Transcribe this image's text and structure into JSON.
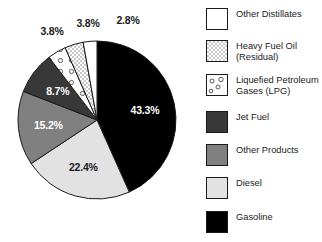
{
  "chart_data": {
    "type": "pie",
    "title": "",
    "subtitle": "",
    "xlabel": "",
    "ylabel": "",
    "start_angle_deg": 0,
    "direction": "clockwise",
    "grid": false,
    "legend_position": "right",
    "categories": [
      "Gasoline",
      "Diesel",
      "Other Products",
      "Jet Fuel",
      "Liquefied Petroleum Gases (LPG)",
      "Heavy Fuel Oil (Residual)",
      "Other Distillates"
    ],
    "values": [
      43.3,
      22.4,
      15.2,
      8.7,
      3.8,
      3.8,
      2.8
    ],
    "data_labels": [
      "43.3%",
      "22.4%",
      "15.2%",
      "8.7%",
      "3.8%",
      "3.8%",
      "2.8%"
    ],
    "units": "percent",
    "slices": [
      {
        "name": "Gasoline",
        "value": 43.3,
        "label": "43.3%",
        "fill": "#000000",
        "pattern": "solid",
        "label_color": "#ffffff"
      },
      {
        "name": "Diesel",
        "value": 22.4,
        "label": "22.4%",
        "fill": "#e2e2e2",
        "pattern": "solid",
        "label_color": "#1a1a1a"
      },
      {
        "name": "Other Products",
        "value": 15.2,
        "label": "15.2%",
        "fill": "#808080",
        "pattern": "solid",
        "label_color": "#ffffff"
      },
      {
        "name": "Jet Fuel",
        "value": 8.7,
        "label": "8.7%",
        "fill": "#383838",
        "pattern": "solid",
        "label_color": "#ffffff"
      },
      {
        "name": "Liquefied Petroleum Gases (LPG)",
        "value": 3.8,
        "label": "3.8%",
        "fill": "#ffffff",
        "pattern": "circles",
        "label_color": "#1a1a1a"
      },
      {
        "name": "Heavy Fuel Oil (Residual)",
        "value": 3.8,
        "label": "3.8%",
        "fill": "#f0f0f0",
        "pattern": "checker",
        "label_color": "#1a1a1a"
      },
      {
        "name": "Other Distillates",
        "value": 2.8,
        "label": "2.8%",
        "fill": "#ffffff",
        "pattern": "solid",
        "label_color": "#1a1a1a"
      }
    ]
  },
  "legend": {
    "items": [
      {
        "label": "Other Distillates",
        "swatch": "white-solid-swatch",
        "fill": "#ffffff",
        "pattern": "solid"
      },
      {
        "label": "Heavy Fuel Oil\n(Residual)",
        "swatch": "checker-pattern-swatch",
        "fill": "#f0f0f0",
        "pattern": "checker"
      },
      {
        "label": "Liquefied Petroleum\nGases (LPG)",
        "swatch": "circles-pattern-swatch",
        "fill": "#ffffff",
        "pattern": "circles"
      },
      {
        "label": "Jet Fuel",
        "swatch": "dark-gray-swatch",
        "fill": "#383838",
        "pattern": "solid"
      },
      {
        "label": "Other Products",
        "swatch": "medium-gray-swatch",
        "fill": "#808080",
        "pattern": "solid"
      },
      {
        "label": "Diesel",
        "swatch": "light-gray-swatch",
        "fill": "#e2e2e2",
        "pattern": "solid"
      },
      {
        "label": "Gasoline",
        "swatch": "black-swatch",
        "fill": "#000000",
        "pattern": "solid"
      }
    ]
  },
  "colors": {
    "background": "#ffffff",
    "outline": "#1a1a1a",
    "text": "#1a1a1a",
    "text_on_dark": "#ffffff"
  }
}
